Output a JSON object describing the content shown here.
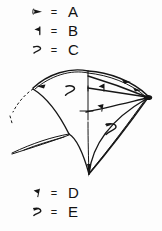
{
  "image": {
    "kind": "hand-drawn-mathematical-diagram",
    "description": "Hand-sketched curved fan / shell surface with arrow-marked edges, above and below it two symbol legends"
  },
  "legend_top": {
    "name": "symbol-legend-top",
    "rows": [
      {
        "symbol": "small-solid-arrowhead-right",
        "equals": "=",
        "letter": "A"
      },
      {
        "symbol": "solid-flag-left-glyph",
        "equals": "=",
        "letter": "B"
      },
      {
        "symbol": "open-hook-right-glyph",
        "equals": "=",
        "letter": "C"
      }
    ]
  },
  "legend_bottom": {
    "name": "symbol-legend-bottom",
    "rows": [
      {
        "symbol": "flag-on-stem-glyph",
        "equals": "=",
        "letter": "D"
      },
      {
        "symbol": "filled-hook-right-glyph",
        "equals": "=",
        "letter": "E"
      }
    ]
  },
  "diagram": {
    "name": "fan-surface-diagram",
    "labels": [
      {
        "id": "label-c-upper-left",
        "text": "C",
        "x": 74,
        "y": 26
      },
      {
        "id": "label-b-upper-right",
        "text": "B",
        "x": 108,
        "y": 22
      },
      {
        "id": "label-a-top-right",
        "text": "A",
        "x": 124,
        "y": 12
      },
      {
        "id": "label-d-center",
        "text": "D",
        "x": 103,
        "y": 44
      },
      {
        "id": "label-e-lower-right",
        "text": "E",
        "x": 113,
        "y": 63
      }
    ],
    "vertices": [
      {
        "id": "apex-top",
        "x": 88,
        "y": 6
      },
      {
        "id": "vertex-right",
        "x": 148,
        "y": 33
      },
      {
        "id": "vertex-bottom",
        "x": 89,
        "y": 111
      },
      {
        "id": "vertex-left",
        "x": 31,
        "y": 25
      }
    ]
  }
}
